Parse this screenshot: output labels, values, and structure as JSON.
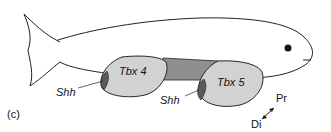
{
  "figure": {
    "panel_label": "(c)",
    "regions": [
      {
        "label": "Tbx 4",
        "role": "posterior fin bud"
      },
      {
        "label": "Tbx 5",
        "role": "anterior fin bud"
      }
    ],
    "shh_labels": [
      "Shh",
      "Shh"
    ],
    "axis": {
      "proximal": "Pr",
      "distal": "Di"
    },
    "colors": {
      "fin_fill": "#d2d2d2",
      "band_fill": "#8f8f8f",
      "shh_fill": "#5a5a5a",
      "outline": "#222222"
    }
  }
}
